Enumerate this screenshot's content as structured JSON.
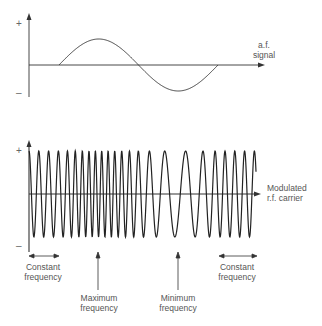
{
  "af_plot": {
    "plus_sign": "+",
    "minus_sign": "–",
    "label_line1": "a.f.",
    "label_line2": "signal"
  },
  "rf_plot": {
    "plus_sign": "+",
    "minus_sign": "–",
    "label_line1": "Modulated",
    "label_line2": "r.f. carrier"
  },
  "annotations": [
    {
      "line1": "Constant",
      "line2": "frequency",
      "kind": "double-arrow"
    },
    {
      "line1": "Maximum",
      "line2": "frequency",
      "kind": "up-arrow"
    },
    {
      "line1": "Minimum",
      "line2": "frequency",
      "kind": "up-arrow"
    },
    {
      "line1": "Constant",
      "line2": "frequency",
      "kind": "double-arrow"
    }
  ],
  "colors": {
    "line": "#333333",
    "text": "#555555",
    "background": "#ffffff"
  }
}
